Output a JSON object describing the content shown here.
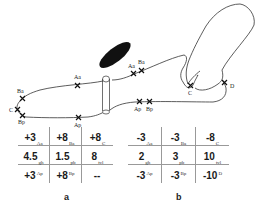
{
  "diagram": {
    "sites_left": {
      "Ba": "Ba",
      "C": "C",
      "Bp": "Bp",
      "Aa": "Aa",
      "Ap": "Ap"
    },
    "sites_right": {
      "Aa": "Aa",
      "Ba": "Ba",
      "Ap": "Ap",
      "Bp": "Bp",
      "C": "C",
      "D": "D"
    }
  },
  "table_a": {
    "label": "a",
    "rows": [
      [
        {
          "value": "+3",
          "site": "Aa",
          "pos": "sub"
        },
        {
          "value": "+8",
          "site": "Ba",
          "pos": "sub"
        },
        {
          "value": "+8",
          "site": "C",
          "pos": "sub"
        }
      ],
      [
        {
          "value": "4.5",
          "site": "gh",
          "pos": "sub"
        },
        {
          "value": "1.5",
          "site": "pb",
          "pos": "sub"
        },
        {
          "value": "8",
          "site": "tvl",
          "pos": "sub"
        }
      ],
      [
        {
          "value": "+3",
          "site": "Ap",
          "pos": "sup"
        },
        {
          "value": "+8",
          "site": "Bp",
          "pos": "sup"
        },
        {
          "value": "--",
          "site": "",
          "pos": "sup"
        }
      ]
    ]
  },
  "table_b": {
    "label": "b",
    "rows": [
      [
        {
          "value": "-3",
          "site": "Aa",
          "pos": "sub"
        },
        {
          "value": "-3",
          "site": "Ba",
          "pos": "sub"
        },
        {
          "value": "-8",
          "site": "C",
          "pos": "sub"
        }
      ],
      [
        {
          "value": "2",
          "site": "gh",
          "pos": "sub"
        },
        {
          "value": "3",
          "site": "pb",
          "pos": "sub"
        },
        {
          "value": "10",
          "site": "tvl",
          "pos": "sub"
        }
      ],
      [
        {
          "value": "-3",
          "site": "Ap",
          "pos": "sup"
        },
        {
          "value": "-3",
          "site": "Bp",
          "pos": "sup"
        },
        {
          "value": "-10",
          "site": "D",
          "pos": "sup"
        }
      ]
    ]
  },
  "colors": {
    "line": "#333333",
    "ellipse": "#111111",
    "grid": "#999999"
  }
}
